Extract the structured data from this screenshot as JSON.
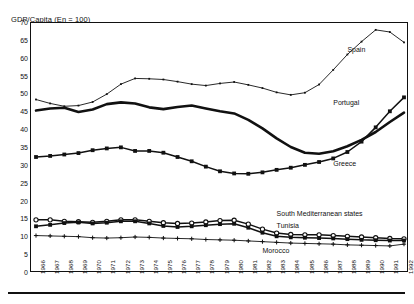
{
  "chart_data": {
    "type": "line",
    "title": "GDP/Capita (En = 100)",
    "xlabel": "",
    "ylabel": "",
    "ylim": [
      0,
      70
    ],
    "ytick_step": 5,
    "yticks": [
      0,
      5,
      10,
      15,
      20,
      25,
      30,
      35,
      40,
      45,
      50,
      55,
      60,
      65,
      70
    ],
    "grid": false,
    "legend_position": "inline-annotations",
    "x": [
      1966,
      1967,
      1968,
      1969,
      1970,
      1971,
      1972,
      1973,
      1974,
      1975,
      1976,
      1977,
      1978,
      1979,
      1980,
      1981,
      1982,
      1983,
      1984,
      1985,
      1986,
      1987,
      1988,
      1989,
      1990,
      1991,
      1992
    ],
    "xtick_labels": [
      "1966",
      "1967",
      "1968",
      "1969",
      "1970",
      "1971",
      "1972",
      "1973",
      "1974",
      "1975",
      "1976",
      "1977",
      "1978",
      "1979",
      "1980",
      "1981",
      "1982",
      "1983",
      "1984",
      "1985",
      "1986",
      "1987",
      "1988",
      "1989",
      "1990",
      "1991",
      "1992"
    ],
    "series": [
      {
        "name": "Spain",
        "marker": "tick",
        "line_width": "thin",
        "label_x": 1988,
        "label_y": 62,
        "values": [
          48.3,
          47.2,
          46.4,
          46.6,
          47.6,
          49.8,
          52.6,
          54.2,
          54.1,
          53.9,
          53.3,
          52.6,
          52.2,
          52.8,
          53.2,
          52.4,
          51.5,
          50.3,
          49.6,
          50.2,
          52.5,
          56.6,
          60.9,
          64.5,
          67.8,
          67.2,
          64.3
        ]
      },
      {
        "name": "Portugal",
        "marker": "none",
        "line_width": "thick",
        "label_x": 1987,
        "label_y": 47,
        "values": [
          45.2,
          45.8,
          46.0,
          44.8,
          45.5,
          47.0,
          47.5,
          47.2,
          46.1,
          45.6,
          46.2,
          46.6,
          45.8,
          45.0,
          44.4,
          42.6,
          40.2,
          37.4,
          35.0,
          33.4,
          33.1,
          33.8,
          35.2,
          37.0,
          39.2,
          42.0,
          44.6
        ]
      },
      {
        "name": "Greece",
        "marker": "square-filled",
        "line_width": "medium",
        "label_x": 1987,
        "label_y": 30,
        "values": [
          32.2,
          32.5,
          32.9,
          33.3,
          34.1,
          34.6,
          34.9,
          33.9,
          33.9,
          33.4,
          32.2,
          31.0,
          29.5,
          28.2,
          27.6,
          27.5,
          27.9,
          28.6,
          29.2,
          30.0,
          30.8,
          31.8,
          33.6,
          36.5,
          40.5,
          45.0,
          48.9
        ]
      },
      {
        "name": "South Mediterranean states",
        "marker": "circle-open",
        "line_width": "medium",
        "label_x": 1983,
        "label_y": 16,
        "values": [
          14.6,
          14.6,
          14.2,
          14.1,
          13.9,
          14.2,
          14.6,
          14.6,
          14.2,
          13.8,
          13.6,
          13.7,
          14.0,
          14.4,
          14.5,
          13.4,
          12.0,
          10.9,
          10.5,
          10.4,
          10.4,
          10.2,
          10.0,
          9.8,
          9.6,
          9.4,
          9.3
        ]
      },
      {
        "name": "Tunisia",
        "marker": "square-filled",
        "line_width": "medium",
        "label_x": 1983,
        "label_y": 12.6,
        "values": [
          12.8,
          13.2,
          13.7,
          13.9,
          13.6,
          13.8,
          14.2,
          14.2,
          13.6,
          12.9,
          12.6,
          12.8,
          13.1,
          13.4,
          13.5,
          12.4,
          11.0,
          10.0,
          9.7,
          9.6,
          9.5,
          9.4,
          9.2,
          9.0,
          8.9,
          8.8,
          8.8
        ]
      },
      {
        "name": "Morocco",
        "marker": "cross",
        "line_width": "thin",
        "label_x": 1982,
        "label_y": 5.6,
        "values": [
          10.2,
          10.1,
          10.0,
          9.9,
          9.6,
          9.5,
          9.6,
          9.8,
          9.7,
          9.5,
          9.4,
          9.3,
          9.1,
          9.0,
          8.9,
          8.7,
          8.5,
          8.3,
          8.1,
          8.0,
          7.9,
          7.8,
          7.6,
          7.5,
          7.4,
          7.3,
          7.8
        ]
      }
    ]
  },
  "colors": {
    "ink": "#111111",
    "background": "#ffffff"
  }
}
